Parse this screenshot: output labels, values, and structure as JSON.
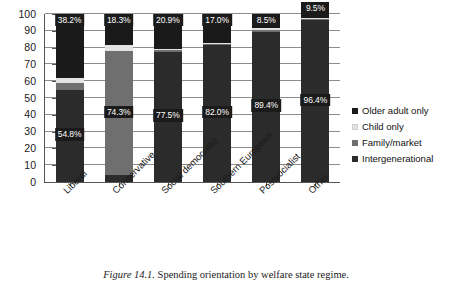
{
  "caption": {
    "label": "Figure 14.1.",
    "text": "Spending orientation by welfare state regime."
  },
  "legend": {
    "items": [
      {
        "label": "Older adult only",
        "color": "#1a1a1a"
      },
      {
        "label": "Child only",
        "color": "#e3e3e3"
      },
      {
        "label": "Family/market",
        "color": "#6f6f6f"
      },
      {
        "label": "Intergenerational",
        "color": "#2b2b2b"
      }
    ]
  },
  "chart_data": {
    "type": "bar",
    "subtype": "stacked-100-percent",
    "title": "",
    "xlabel": "",
    "ylabel": "",
    "ylim": [
      0,
      100
    ],
    "yticks": [
      0,
      10,
      20,
      30,
      40,
      50,
      60,
      70,
      80,
      90,
      100
    ],
    "grid": true,
    "legend_position": "right",
    "categories": [
      "Liberal",
      "Conservative",
      "Social democratic",
      "Southern European",
      "Postsocialist",
      "Other"
    ],
    "series": [
      {
        "name": "Older adult only",
        "color": "#1a1a1a",
        "values": [
          38.2,
          18.3,
          20.9,
          17.0,
          8.5,
          9.5
        ],
        "labels": [
          "38.2%",
          "18.3%",
          "20.9%",
          "17.0%",
          "8.5%",
          "9.5%"
        ]
      },
      {
        "name": "Child only",
        "color": "#e3e3e3",
        "values": [
          3.0,
          3.5,
          0.5,
          0.6,
          1.0,
          0.6
        ],
        "labels": [
          "",
          "",
          "",
          "",
          "",
          ""
        ]
      },
      {
        "name": "Family/market",
        "color": "#6f6f6f",
        "values": [
          4.0,
          74.3,
          1.1,
          0.4,
          1.1,
          0.5
        ],
        "labels": [
          "",
          "74.3%",
          "",
          "",
          "",
          ""
        ]
      },
      {
        "name": "Intergenerational",
        "color": "#2b2b2b",
        "values": [
          54.8,
          3.9,
          77.5,
          82.0,
          89.4,
          96.4
        ],
        "labels": [
          "54.8%",
          "",
          "77.5%",
          "82.0%",
          "89.4%",
          "96.4%"
        ]
      }
    ]
  }
}
